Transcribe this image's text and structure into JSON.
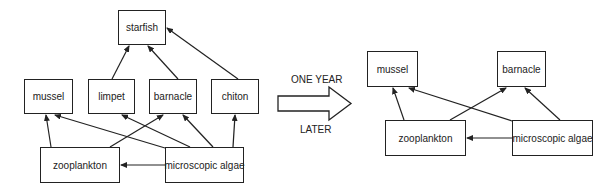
{
  "diagram": {
    "type": "food-web-comparison",
    "transition": {
      "top_label": "ONE YEAR",
      "bottom_label": "LATER"
    },
    "before": {
      "nodes": [
        {
          "id": "starfish",
          "label": "starfish"
        },
        {
          "id": "mussel",
          "label": "mussel"
        },
        {
          "id": "limpet",
          "label": "limpet"
        },
        {
          "id": "barnacle",
          "label": "barnacle"
        },
        {
          "id": "chiton",
          "label": "chiton"
        },
        {
          "id": "zooplankton",
          "label": "zooplankton"
        },
        {
          "id": "algae",
          "label": "microscopic algae"
        }
      ],
      "edges": [
        {
          "from": "limpet",
          "to": "starfish"
        },
        {
          "from": "barnacle",
          "to": "starfish"
        },
        {
          "from": "chiton",
          "to": "starfish"
        },
        {
          "from": "zooplankton",
          "to": "mussel"
        },
        {
          "from": "zooplankton",
          "to": "barnacle"
        },
        {
          "from": "algae",
          "to": "mussel"
        },
        {
          "from": "algae",
          "to": "limpet"
        },
        {
          "from": "algae",
          "to": "barnacle"
        },
        {
          "from": "algae",
          "to": "chiton"
        },
        {
          "from": "algae",
          "to": "zooplankton"
        }
      ]
    },
    "after": {
      "nodes": [
        {
          "id": "mussel",
          "label": "mussel"
        },
        {
          "id": "barnacle",
          "label": "barnacle"
        },
        {
          "id": "zooplankton",
          "label": "zooplankton"
        },
        {
          "id": "algae",
          "label": "microscopic algae"
        }
      ],
      "edges": [
        {
          "from": "zooplankton",
          "to": "mussel"
        },
        {
          "from": "zooplankton",
          "to": "barnacle"
        },
        {
          "from": "algae",
          "to": "mussel"
        },
        {
          "from": "algae",
          "to": "barnacle"
        },
        {
          "from": "algae",
          "to": "zooplankton"
        }
      ]
    }
  }
}
